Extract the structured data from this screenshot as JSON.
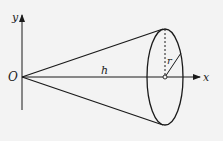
{
  "diagram": {
    "labels": {
      "origin": "O",
      "y_axis": "y",
      "x_axis": "x",
      "height": "h",
      "radius": "r"
    },
    "colors": {
      "stroke": "#1a1a1a",
      "background": "#f3f3f3"
    }
  }
}
